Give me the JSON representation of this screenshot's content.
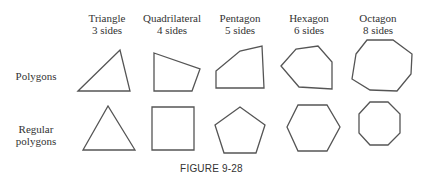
{
  "figure": {
    "caption": "FIGURE 9-28",
    "columns": [
      {
        "name": "Triangle",
        "sides": "3 sides"
      },
      {
        "name": "Quadrilateral",
        "sides": "4 sides"
      },
      {
        "name": "Pentagon",
        "sides": "5 sides"
      },
      {
        "name": "Hexagon",
        "sides": "6 sides"
      },
      {
        "name": "Octagon",
        "sides": "8 sides"
      }
    ],
    "rows": [
      {
        "label_line1": "Polygons",
        "label_line2": ""
      },
      {
        "label_line1": "Regular",
        "label_line2": "polygons"
      }
    ],
    "shapes": {
      "irregular": [
        {
          "name": "triangle",
          "points": "78,91 120,50 130,91"
        },
        {
          "name": "quadrilateral",
          "points": "154,53 200,69 192,91 154,91"
        },
        {
          "name": "pentagon",
          "points": "216,71 240,51 262,46 264,88 216,88"
        },
        {
          "name": "hexagon",
          "points": "281,66 296,49 318,46 332,62 332,89 299,87"
        },
        {
          "name": "octagon",
          "points": "356,54 367,40 393,40 412,54 411,74 397,91 370,90 352,79"
        }
      ],
      "regular": [
        {
          "name": "triangle",
          "points": "83,150 108,106 135,150"
        },
        {
          "name": "square",
          "points": "152,107 194,107 194,150 152,150"
        },
        {
          "name": "pentagon",
          "points": "215,125 240,107 265,125 256,153 224,153"
        },
        {
          "name": "hexagon",
          "points": "287,127 298,105 327,105 340,127 327,151 298,151"
        },
        {
          "name": "octagon",
          "points": "359,114 370,102 388,102 400,114 400,133 388,145 370,145 359,133"
        }
      ]
    },
    "colors": {
      "stroke": "#555555",
      "text": "#333333",
      "background": "#ffffff"
    }
  }
}
